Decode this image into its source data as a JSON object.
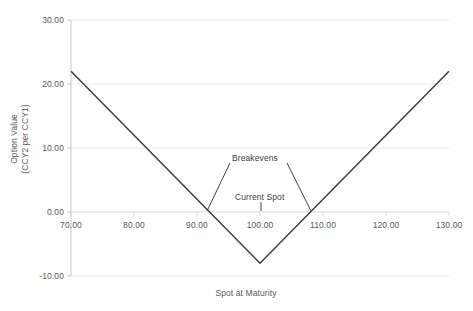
{
  "chart_data": {
    "type": "line",
    "title": "",
    "xlabel": "Spot at Maturity",
    "ylabel": "Option Value\n(CCY2 per CCY1)",
    "ylabel_line1": "Option Value",
    "ylabel_line2": "(CCY2 per CCY1)",
    "xlim": [
      70,
      130
    ],
    "ylim": [
      -10,
      30
    ],
    "xticks": [
      70,
      80,
      90,
      100,
      110,
      120,
      130
    ],
    "xtick_labels": [
      "70.00",
      "80.00",
      "90.00",
      "100.00",
      "110.00",
      "120.00",
      "130.00"
    ],
    "yticks": [
      -10,
      0,
      10,
      20,
      30
    ],
    "ytick_labels": [
      "-10.00",
      "0.00",
      "10.00",
      "20.00",
      "30.00"
    ],
    "grid": true,
    "grid_axis": "y",
    "legend": false,
    "series": [
      {
        "name": "Option Value",
        "x": [
          70,
          100,
          130
        ],
        "values": [
          22.0,
          -8.0,
          22.0
        ],
        "color": "#404040"
      }
    ],
    "annotations": [
      {
        "label": "Breakevens",
        "points": [
          {
            "x": 92.3,
            "y": 0.0
          },
          {
            "x": 108.3,
            "y": 0.0
          }
        ]
      },
      {
        "label": "Current Spot",
        "points": [
          {
            "x": 100.0,
            "y": 0.0
          }
        ]
      }
    ],
    "colors": {
      "series_line": "#404040",
      "gridline": "#e8e8e8",
      "axis_line": "#c8c8c8",
      "tick_text": "#595959",
      "annotation_text": "#404040",
      "background": "#ffffff"
    }
  }
}
